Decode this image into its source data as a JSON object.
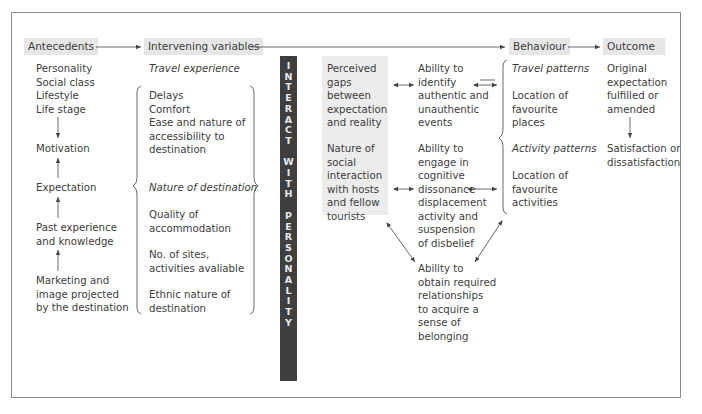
{
  "headers": {
    "antecedents": "Antecedents",
    "intervening": "Intervening variables",
    "behaviour": "Behaviour",
    "outcome": "Outcome"
  },
  "antecedents": {
    "items": [
      "Personality",
      "Social class",
      "Lifestyle",
      "Life stage"
    ],
    "motivation": "Motivation",
    "expectation": "Expectation",
    "past_experience": [
      "Past experience",
      "and knowledge"
    ],
    "marketing": [
      "Marketing and",
      "image projected",
      "by the destination"
    ]
  },
  "intervening": {
    "travel_experience_title": "Travel experience",
    "travel_experience_items": [
      "Delays",
      "Comfort",
      "Ease and nature of",
      "accessibility to",
      "destination"
    ],
    "nature_title": "Nature of destination",
    "quality": [
      "Quality of",
      "accommodation"
    ],
    "sites": [
      "No. of sites,",
      "activities avaliable"
    ],
    "ethnic": [
      "Ethnic nature of",
      "destination"
    ]
  },
  "interact_bar": {
    "letters": [
      "I",
      "N",
      "T",
      "E",
      "R",
      "A",
      "C",
      "T",
      "",
      "W",
      "I",
      "T",
      "H",
      "",
      "P",
      "E",
      "R",
      "S",
      "O",
      "N",
      "A",
      "L",
      "I",
      "T",
      "Y"
    ]
  },
  "perceived": {
    "gaps": [
      "Perceived",
      "gaps",
      "between",
      "expectation",
      "and reality"
    ],
    "social": [
      "Nature of",
      "social",
      "interaction",
      "with hosts",
      "and fellow",
      "tourists"
    ]
  },
  "abilities": {
    "identify": [
      "Ability to",
      "identify",
      "authentic and",
      "unauthentic",
      "events"
    ],
    "engage": [
      "Ability to",
      "engage in",
      "cognitive",
      "dissonance",
      "displacement",
      "activity and",
      "suspension",
      "of disbelief"
    ],
    "obtain": [
      "Ability to",
      "obtain required",
      "relationships",
      "to acquire a",
      "sense of",
      "belonging"
    ]
  },
  "behaviour": {
    "travel_title": "Travel patterns",
    "travel_items": [
      "Location of",
      "favourite",
      "places"
    ],
    "activity_title": "Activity patterns",
    "activity_items": [
      "Location of",
      "favourite",
      "activities"
    ]
  },
  "outcome": {
    "original": [
      "Original",
      "expectation",
      "fulfilled or",
      "amended"
    ],
    "satisfaction": [
      "Satisfaction or",
      "dissatisfaction"
    ]
  },
  "colors": {
    "header_bg": "#e6e6e6",
    "bar_bg": "#3f3f3f",
    "perceived_bg": "#ececec",
    "line": "#444444"
  }
}
